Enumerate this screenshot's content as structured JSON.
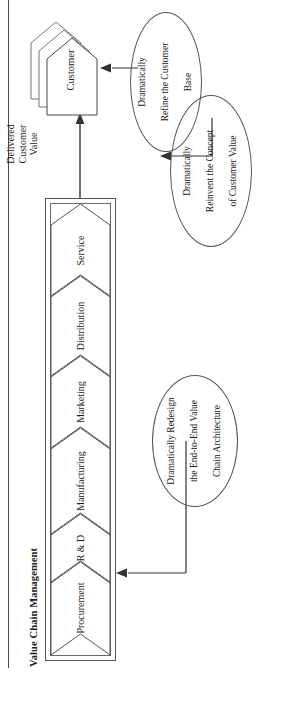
{
  "figure": {
    "section_title": "Value Chain Management",
    "value_chain": {
      "stages": [
        {
          "label": "Procurement"
        },
        {
          "label": "R & D"
        },
        {
          "label": "Manufacturing"
        },
        {
          "label": "Marketing"
        },
        {
          "label": "Distribution"
        },
        {
          "label": "Service"
        }
      ]
    },
    "flow": {
      "delivered_value_label": "Delivered\nCustomer\nValue",
      "delivered_value_lines": [
        "Delivered",
        "Customer",
        "Value"
      ]
    },
    "customer": {
      "label": "Customer",
      "stack_count": 3
    },
    "callouts": [
      {
        "id": "redesign",
        "lines": [
          "Dramatically Redesign",
          "the End-to-End Value",
          "Chain Architecture"
        ],
        "target": "value-chain"
      },
      {
        "id": "reinvent",
        "lines": [
          "Dramatically",
          "Reinvent the Concept",
          "of Customer Value"
        ],
        "target": "delivered-customer-value"
      },
      {
        "id": "refine",
        "lines": [
          "Dramatically",
          "Refine the Customer",
          "Base"
        ],
        "target": "customer"
      }
    ],
    "colors": {
      "line": "#555555",
      "text": "#1a1a1a",
      "background": "#ffffff"
    }
  }
}
